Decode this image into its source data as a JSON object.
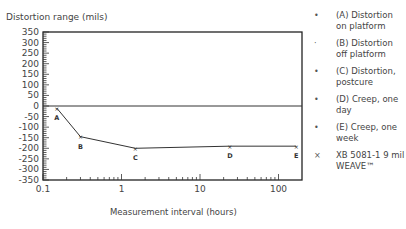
{
  "chart_data": {
    "type": "line",
    "title": "",
    "ylabel": "Distortion range (mils)",
    "xlabel": "Measurement interval (hours)",
    "xscale": "log",
    "xlim": [
      0.1,
      200
    ],
    "ylim": [
      -350,
      350
    ],
    "yticks": [
      350,
      300,
      250,
      200,
      150,
      100,
      50,
      0,
      -50,
      -100,
      -150,
      -200,
      -250,
      -300,
      -350
    ],
    "xticks": [
      0.1,
      1,
      10,
      100
    ],
    "xtick_labels": [
      "0.1",
      "1",
      "10",
      "100"
    ],
    "grid": false,
    "reference_line_y": 0,
    "series": [
      {
        "name": "XB 5081-1 9 mil WEAVE™",
        "marker": "x",
        "points": [
          {
            "label": "A",
            "x": 0.15,
            "y": -10
          },
          {
            "label": "B",
            "x": 0.3,
            "y": -145
          },
          {
            "label": "C",
            "x": 1.5,
            "y": -200
          },
          {
            "label": "D",
            "x": 24,
            "y": -190
          },
          {
            "label": "E",
            "x": 168,
            "y": -190
          }
        ]
      }
    ],
    "legend_position": "right"
  },
  "axis": {
    "y_title": "Distortion range (mils)",
    "x_title": "Measurement interval (hours)"
  },
  "legend": {
    "items": [
      {
        "marker": "•",
        "text": "(A) Distortion on platform"
      },
      {
        "marker": "·",
        "text": "(B) Distortion off platform"
      },
      {
        "marker": "•",
        "text": "(C) Distortion, postcure"
      },
      {
        "marker": "•",
        "text": "(D) Creep, one day"
      },
      {
        "marker": "•",
        "text": "(E) Creep, one week"
      },
      {
        "marker": "×",
        "text": "XB 5081-1 9 mil WEAVE™"
      }
    ]
  }
}
